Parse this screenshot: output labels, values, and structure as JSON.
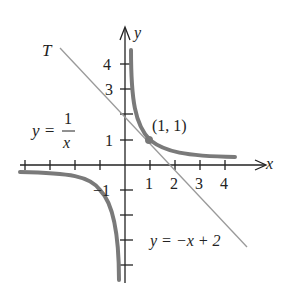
{
  "diagram": {
    "axes": {
      "x_label": "x",
      "y_label": "y",
      "x_ticks": [
        "1",
        "2",
        "3",
        "4"
      ],
      "y_ticks": [
        "1",
        "3",
        "4"
      ],
      "y_neg_tick": "−1"
    },
    "curve_label": {
      "lhs": "y =",
      "num": "1",
      "den": "x"
    },
    "tangent_label": "T",
    "tangent_equation": "y = −x + 2",
    "point_label": "(1, 1)",
    "colors": {
      "curve": "#7a7a7a",
      "tangent": "#9a9a9a",
      "axes": "#222222"
    }
  }
}
